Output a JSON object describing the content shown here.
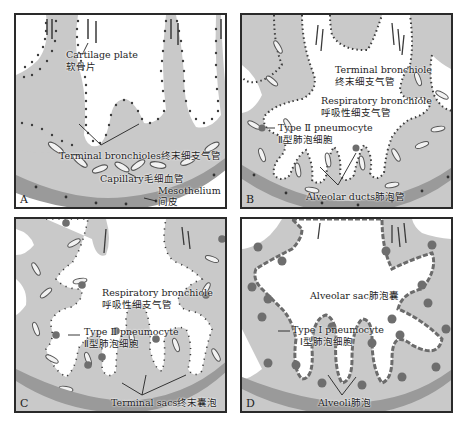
{
  "figure": {
    "colors": {
      "tissue": "#c9c9c9",
      "mesothelium": "#9a9a9a",
      "epithelium_dots": "#3c3c3c",
      "type2_cell": "#6e6e6e",
      "lumen": "#ffffff",
      "border": "#2a2a2a"
    },
    "panels": [
      {
        "letter": "A",
        "labels": {
          "cartilage_en": "Cartilage plate",
          "cartilage_zh": "软骨片",
          "terminal_bronchioles": "Terminal bronchioles终末细支气管",
          "capillary": "Capillary毛细血管",
          "mesothelium_en": "Mesothelium",
          "mesothelium_zh": "间皮"
        }
      },
      {
        "letter": "B",
        "labels": {
          "terminal_bronchiole_en": "Terminal bronchiole",
          "terminal_bronchiole_zh": "终末细支气管",
          "respiratory_bronchiole_en": "Respiratory bronchiole",
          "respiratory_bronchiole_zh": "呼吸性细支气管",
          "type2_en": "Type Ⅱ pneumocyte",
          "type2_zh": "Ⅱ型肺泡细胞",
          "alveolar_ducts": "Alveolar ducts肺泡管"
        }
      },
      {
        "letter": "C",
        "labels": {
          "respiratory_bronchiole_en": "Respiratory bronchiole",
          "respiratory_bronchiole_zh": "呼吸性细支气管",
          "type2_en": "Type Ⅱ pneumocyte",
          "type2_zh": "Ⅱ型肺泡细胞",
          "terminal_sacs": "Terminal sacs终末囊泡"
        }
      },
      {
        "letter": "D",
        "labels": {
          "alveolar_sac": "Alveolar sac肺泡囊",
          "type1_en": "Type Ⅰ pneumocyte",
          "type1_zh": "Ⅰ型肺泡细胞",
          "alveoli": "Alveoli肺泡"
        }
      }
    ]
  }
}
